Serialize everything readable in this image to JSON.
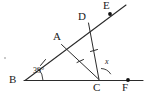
{
  "figure": {
    "type": "geometry-diagram",
    "stroke_color": "#2b2b2b",
    "background_color": "#ffffff"
  },
  "points": [
    {
      "id": "B",
      "label": "B",
      "x": 25,
      "y": 81,
      "label_x": 9,
      "label_y": 75,
      "marker": false
    },
    {
      "id": "A",
      "label": "A",
      "x": 62,
      "y": 44,
      "label_x": 54,
      "label_y": 32,
      "marker": false
    },
    {
      "id": "D",
      "label": "D",
      "x": 88,
      "y": 23,
      "label_x": 78,
      "label_y": 12,
      "marker": false
    },
    {
      "id": "E",
      "label": "E",
      "x": 110,
      "y": 14,
      "label_x": 104,
      "label_y": 1,
      "marker": true
    },
    {
      "id": "C",
      "label": "C",
      "x": 99,
      "y": 80,
      "label_x": 94,
      "label_y": 83,
      "marker": false
    },
    {
      "id": "F",
      "label": "F",
      "x": 128,
      "y": 80,
      "label_x": 123,
      "label_y": 83,
      "marker": true
    }
  ],
  "segments": [
    {
      "id": "BF",
      "from": "B",
      "to": "F",
      "note": "horizontal base line through C"
    },
    {
      "id": "BE",
      "from": "B",
      "to": "E",
      "note": "ray through A and D, extends past E"
    },
    {
      "id": "AC",
      "from": "A",
      "to": "C",
      "note": "cevian, tick marked"
    },
    {
      "id": "DC",
      "from": "D",
      "to": "C",
      "note": "segment, tick marked"
    }
  ],
  "tick_marks": [
    {
      "on": "BA",
      "count": 1,
      "x": 43,
      "y": 62
    },
    {
      "on": "AC",
      "count": 1,
      "x": 80,
      "y": 62
    },
    {
      "on": "DC",
      "count": 1,
      "x": 94,
      "y": 51
    }
  ],
  "angles": [
    {
      "at": "B",
      "label": "39°",
      "label_x": 33,
      "label_y": 68,
      "arc": true
    },
    {
      "at": "C",
      "label": "x",
      "label_x": 105,
      "label_y": 60,
      "arc": true,
      "italic": true,
      "degree_mark": true
    }
  ],
  "labels": {
    "angle_b": "39°",
    "angle_x": "x",
    "point_a": "A",
    "point_b": "B",
    "point_c": "C",
    "point_d": "D",
    "point_e": "E",
    "point_f": "F"
  }
}
